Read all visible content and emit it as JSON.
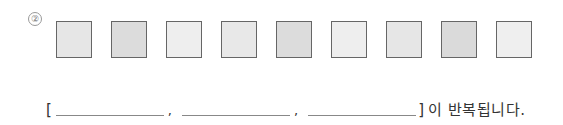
{
  "problem": {
    "number_label": "②",
    "squares": [
      {
        "index": 1,
        "color": "#e6e6e6",
        "left": 56
      },
      {
        "index": 2,
        "color": "#dcdcdc",
        "left": 111
      },
      {
        "index": 3,
        "color": "#eeeeee",
        "left": 166
      },
      {
        "index": 4,
        "color": "#e8e8e8",
        "left": 221
      },
      {
        "index": 5,
        "color": "#dcdcdc",
        "left": 276
      },
      {
        "index": 6,
        "color": "#eeeeee",
        "left": 331
      },
      {
        "index": 7,
        "color": "#e6e6e6",
        "left": 386
      },
      {
        "index": 8,
        "color": "#dadada",
        "left": 441
      },
      {
        "index": 9,
        "color": "#efefef",
        "left": 496
      }
    ],
    "answer_line": {
      "open_bracket": "[",
      "blanks": [
        "",
        "",
        ""
      ],
      "separator": ",",
      "close_bracket": "]",
      "suffix": "이 반복됩니다."
    }
  }
}
